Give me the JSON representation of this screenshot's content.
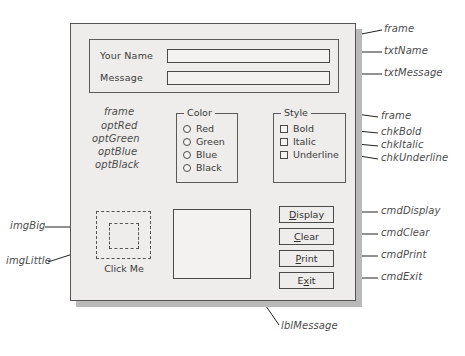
{
  "diagram": {
    "title_absent": true,
    "form": {
      "top_frame": {
        "fields": [
          {
            "label": "Your Name",
            "value": "",
            "control": "txtName"
          },
          {
            "label": "Message",
            "value": "",
            "control": "txtMessage"
          }
        ]
      },
      "color_group": {
        "caption": "Color",
        "options": [
          {
            "label": "Red",
            "control": "optRed",
            "selected": false
          },
          {
            "label": "Green",
            "control": "optGreen",
            "selected": false
          },
          {
            "label": "Blue",
            "control": "optBlue",
            "selected": false
          },
          {
            "label": "Black",
            "control": "optBlack",
            "selected": false
          }
        ]
      },
      "style_group": {
        "caption": "Style",
        "checkboxes": [
          {
            "label": "Bold",
            "control": "chkBold",
            "checked": false
          },
          {
            "label": "Italic",
            "control": "chkItalic",
            "checked": false
          },
          {
            "label": "Underline",
            "control": "chkUnderline",
            "checked": false
          }
        ]
      },
      "images": {
        "big": "imgBig",
        "little": "imgLittle",
        "caption": "Click Me"
      },
      "message_label": {
        "control": "lblMessage",
        "text": ""
      },
      "buttons": [
        {
          "text": "Display",
          "accel": "D",
          "before": "",
          "after": "isplay",
          "control": "cmdDisplay"
        },
        {
          "text": "Clear",
          "accel": "C",
          "before": "",
          "after": "lear",
          "control": "cmdClear"
        },
        {
          "text": "Print",
          "accel": "P",
          "before": "",
          "after": "rint",
          "control": "cmdPrint"
        },
        {
          "text": "Exit",
          "accel": "x",
          "before": "E",
          "after": "it",
          "control": "cmdExit"
        }
      ]
    },
    "annotations": {
      "frame_top": "frame",
      "txt_name": "txtName",
      "txt_message": "txtMessage",
      "frame_color": "frame",
      "opt_red": "optRed",
      "opt_green": "optGreen",
      "opt_blue": "optBlue",
      "opt_black": "optBlack",
      "frame_style": "frame",
      "chk_bold": "chkBold",
      "chk_italic": "chkItalic",
      "chk_underline": "chkUnderline",
      "cmd_display": "cmdDisplay",
      "cmd_clear": "cmdClear",
      "cmd_print": "cmdPrint",
      "cmd_exit": "cmdExit",
      "img_big": "imgBig",
      "img_little": "imgLittle",
      "lbl_message": "lblMessage"
    },
    "colors": {
      "form_face": "#eeedeb",
      "border": "#4a4a4a",
      "shadow": "#b9b9b9",
      "annotation_text": "#4b4b4b",
      "leader": "#222222"
    }
  }
}
